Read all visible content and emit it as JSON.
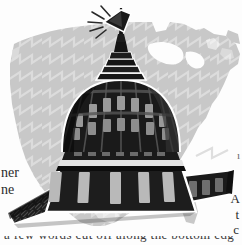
{
  "illustration": {
    "title": "US Capitol dome over United States map",
    "subject": "capitol-dome",
    "background_subject": "united-states-map-silhouette",
    "style": "black-and-white halftone engraving",
    "flag_label": "american-flag-on-dome",
    "colors": {
      "page_background": "#fdfdfd",
      "map_gray": "#c8c8c8",
      "map_texture_line": "#dedede",
      "dome_dark": "#1a1a1a",
      "dome_mid": "#3a3a3a",
      "dome_shadow": "#0d0d0d",
      "highlight_band": "#e8e8e8",
      "outline_white": "#ffffff",
      "text_ink": "#2b2b2b"
    }
  },
  "bleed_text": {
    "left_line_1": "ner",
    "left_line_2": "ne",
    "right_line_1": "ı",
    "right_line_2": "A",
    "right_line_3": "t",
    "right_line_4": "c",
    "bottom_line": "a few words cut off along the bottom edge"
  }
}
